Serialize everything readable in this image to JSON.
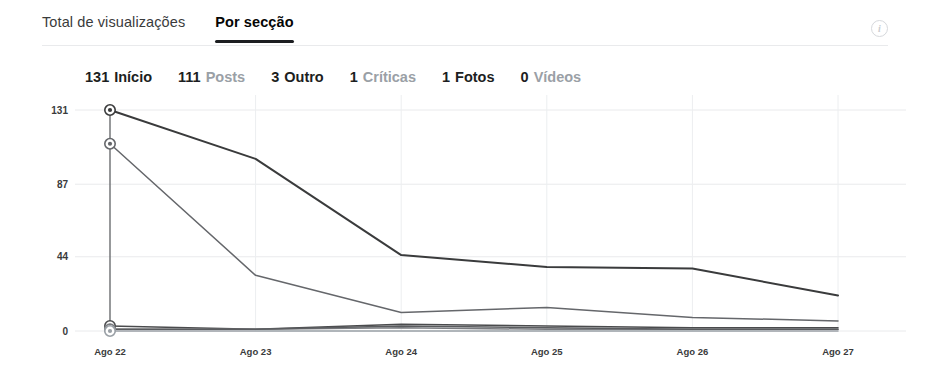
{
  "tabs": [
    {
      "label": "Total de visualizações",
      "active": false
    },
    {
      "label": "Por secção",
      "active": true
    }
  ],
  "info_icon": {
    "glyph": "i",
    "name": "info-icon"
  },
  "legend": [
    {
      "value": "131",
      "label": "Início",
      "muted": false
    },
    {
      "value": "111",
      "label": "Posts",
      "muted": true
    },
    {
      "value": "3",
      "label": "Outro",
      "muted": false
    },
    {
      "value": "1",
      "label": "Críticas",
      "muted": true
    },
    {
      "value": "1",
      "label": "Fotos",
      "muted": false
    },
    {
      "value": "0",
      "label": "Vídeos",
      "muted": true
    }
  ],
  "chart_data": {
    "type": "line",
    "title": "",
    "xlabel": "",
    "ylabel": "",
    "grid": true,
    "legend_position": "top",
    "categories": [
      "Ago 22",
      "Ago 23",
      "Ago 24",
      "Ago 25",
      "Ago 26",
      "Ago 27"
    ],
    "yticks": [
      0,
      44,
      87,
      131
    ],
    "ylim": [
      0,
      131
    ],
    "series": [
      {
        "name": "Início",
        "color": "#3a3b3c",
        "values": [
          131,
          102,
          45,
          38,
          37,
          21
        ]
      },
      {
        "name": "Posts",
        "color": "#65676b",
        "values": [
          111,
          33,
          11,
          14,
          8,
          6
        ]
      },
      {
        "name": "Outro",
        "color": "#4a4b4d",
        "values": [
          3,
          1,
          4,
          3,
          2,
          2
        ]
      },
      {
        "name": "Críticas",
        "color": "#7a7c80",
        "values": [
          1,
          1,
          2,
          1,
          1,
          1
        ]
      },
      {
        "name": "Fotos",
        "color": "#5a5c5f",
        "values": [
          1,
          1,
          3,
          2,
          1,
          1
        ]
      },
      {
        "name": "Vídeos",
        "color": "#9aa0a6",
        "values": [
          0,
          0,
          0,
          0,
          0,
          0
        ]
      }
    ],
    "markers_at_first_point": true
  }
}
